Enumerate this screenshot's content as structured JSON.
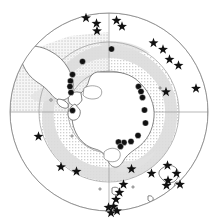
{
  "figure": {
    "type": "polar-stereographic-map",
    "region_name": "Antarctica",
    "projection_center": {
      "x": 109,
      "y": 112
    },
    "outer_radius": 99,
    "background_color": "#ffffff",
    "land_outline_color": "#555555",
    "graticule_color": "#8a8a8a",
    "stipple_color": "#c8c8c8",
    "ice_band_color": "#d9d9d9",
    "dot_color": "#111111",
    "star_color": "#111111"
  },
  "legend": {
    "dot_label": "sampling station",
    "star_label": "reference site"
  },
  "graticule": {
    "latitude_circles": [
      99,
      70,
      41
    ],
    "meridian_count": 4,
    "meridian_angles_deg": [
      0,
      90,
      180,
      270
    ]
  },
  "chart_data": {
    "type": "scatter",
    "title": "",
    "xlabel": "",
    "ylabel": "",
    "projection": "polar stereographic, south pole centered",
    "series": [
      {
        "name": "dots",
        "marker": "filled-circle",
        "color": "#111111",
        "radius": 3.1,
        "points": [
          [
            111.5,
            49.0
          ],
          [
            82.5,
            61.5
          ],
          [
            72.5,
            74.5
          ],
          [
            70.5,
            81.0
          ],
          [
            70.0,
            86.5
          ],
          [
            71.0,
            92.5
          ],
          [
            72.5,
            110.5
          ],
          [
            138.5,
            86.5
          ],
          [
            141.0,
            91.5
          ],
          [
            142.5,
            97.5
          ],
          [
            144.5,
            110.0
          ],
          [
            145.5,
            123.0
          ],
          [
            138.0,
            135.5
          ],
          [
            131.0,
            141.5
          ],
          [
            124.0,
            142.5
          ],
          [
            118.5,
            142.0
          ],
          [
            120.5,
            146.5
          ]
        ]
      },
      {
        "name": "stars",
        "marker": "five-point-star",
        "color": "#111111",
        "radius": 5.2,
        "points": [
          [
            86.0,
            18.0
          ],
          [
            96.5,
            23.5
          ],
          [
            116.5,
            20.5
          ],
          [
            97.0,
            31.0
          ],
          [
            122.0,
            26.5
          ],
          [
            153.5,
            43.0
          ],
          [
            163.0,
            49.5
          ],
          [
            169.5,
            59.5
          ],
          [
            178.5,
            65.5
          ],
          [
            166.0,
            92.0
          ],
          [
            196.0,
            88.5
          ],
          [
            38.5,
            136.5
          ],
          [
            61.0,
            167.0
          ],
          [
            76.5,
            171.5
          ],
          [
            131.5,
            169.0
          ],
          [
            151.5,
            173.5
          ],
          [
            167.5,
            165.5
          ],
          [
            168.0,
            180.5
          ],
          [
            176.5,
            173.5
          ],
          [
            180.0,
            184.5
          ],
          [
            166.5,
            185.5
          ],
          [
            123.5,
            184.5
          ],
          [
            119.5,
            192.5
          ],
          [
            116.0,
            199.5
          ],
          [
            113.5,
            206.5
          ],
          [
            117.0,
            211.0
          ],
          [
            111.0,
            213.0
          ],
          [
            108.5,
            207.5
          ]
        ]
      }
    ]
  },
  "landmasses": [
    {
      "name": "antarctica",
      "label": "Antarctica"
    },
    {
      "name": "south-america-tip",
      "label": "South America"
    },
    {
      "name": "new-zealand",
      "label": "New Zealand"
    }
  ]
}
